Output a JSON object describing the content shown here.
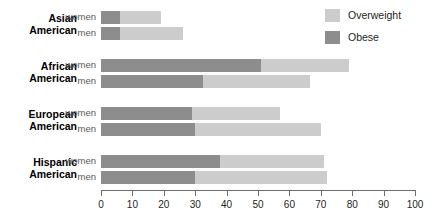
{
  "chart_data": {
    "type": "bar",
    "orientation": "horizontal",
    "stacked": true,
    "title": "",
    "subtitle": "",
    "xlabel": "",
    "ylabel": "",
    "xlim": [
      0,
      100
    ],
    "xticks": [
      0,
      10,
      20,
      30,
      40,
      50,
      60,
      70,
      80,
      90,
      100
    ],
    "xtick_labels": [
      "0",
      "10",
      "20",
      "30",
      "40",
      "50",
      "60",
      "70",
      "80",
      "90",
      "100"
    ],
    "grid": false,
    "legend_position": "top-right",
    "legend": [
      {
        "name": "Overweight",
        "color": "#cccccc"
      },
      {
        "name": "Obese",
        "color": "#8d8d8d"
      }
    ],
    "groups": [
      {
        "label_lines": [
          "Asian",
          "American"
        ],
        "rows": [
          {
            "series_label": "women",
            "obese": 6,
            "overweight": 13,
            "total": 19
          },
          {
            "series_label": "men",
            "obese": 6,
            "overweight": 20,
            "total": 26
          }
        ]
      },
      {
        "label_lines": [
          "African",
          "American"
        ],
        "rows": [
          {
            "series_label": "women",
            "obese": 51,
            "overweight": 28,
            "total": 79
          },
          {
            "series_label": "men",
            "obese": 32.5,
            "overweight": 34,
            "total": 66.5
          }
        ]
      },
      {
        "label_lines": [
          "European",
          "American"
        ],
        "rows": [
          {
            "series_label": "women",
            "obese": 29,
            "overweight": 28,
            "total": 57
          },
          {
            "series_label": "men",
            "obese": 30,
            "overweight": 40,
            "total": 70
          }
        ]
      },
      {
        "label_lines": [
          "Hispanic",
          "American"
        ],
        "rows": [
          {
            "series_label": "women",
            "obese": 38,
            "overweight": 33,
            "total": 71
          },
          {
            "series_label": "men",
            "obese": 30,
            "overweight": 42,
            "total": 72
          }
        ]
      }
    ],
    "series": [
      {
        "name": "Obese",
        "categories": [
          "Asian American women",
          "Asian American men",
          "African American women",
          "African American men",
          "European American women",
          "European American men",
          "Hispanic American women",
          "Hispanic American men"
        ],
        "values": [
          6,
          6,
          51,
          32.5,
          29,
          30,
          38,
          30
        ]
      },
      {
        "name": "Overweight",
        "categories": [
          "Asian American women",
          "Asian American men",
          "African American women",
          "African American men",
          "European American women",
          "European American men",
          "Hispanic American women",
          "Hispanic American men"
        ],
        "values": [
          13,
          20,
          28,
          34,
          28,
          40,
          33,
          42
        ]
      }
    ],
    "colors": {
      "overweight": "#cccccc",
      "obese": "#8d8d8d",
      "axis": "#6d6e71",
      "category_label": "#000000",
      "series_label": "#58595b",
      "background": "#ffffff"
    }
  }
}
